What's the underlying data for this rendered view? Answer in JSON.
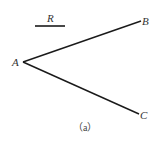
{
  "figure": {
    "caption": "（a）",
    "colors": {
      "line": "#1a1a1a",
      "label": "#333333",
      "background": "#ffffff"
    },
    "segment_r": {
      "label": "R",
      "x1": 35,
      "y1": 26,
      "x2": 65,
      "y2": 26
    },
    "points": {
      "A": {
        "label": "A",
        "x": 23,
        "y": 62
      },
      "B": {
        "label": "B",
        "x": 141,
        "y": 21
      },
      "C": {
        "label": "C",
        "x": 139,
        "y": 114
      }
    },
    "rays": [
      {
        "from": "A",
        "to": "B"
      },
      {
        "from": "A",
        "to": "C"
      }
    ]
  }
}
